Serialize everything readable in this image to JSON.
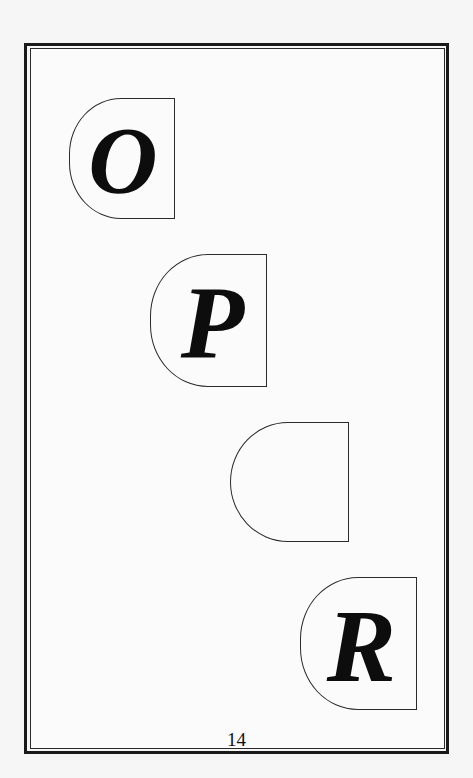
{
  "page": {
    "page_number": "14",
    "background_color": "#f6f6f6",
    "frame_color": "#1a1a1a"
  },
  "tiles": [
    {
      "letter": "O",
      "label": "tile-o"
    },
    {
      "letter": "P",
      "label": "tile-p"
    },
    {
      "letter": "",
      "label": "tile-empty"
    },
    {
      "letter": "R",
      "label": "tile-r"
    }
  ]
}
